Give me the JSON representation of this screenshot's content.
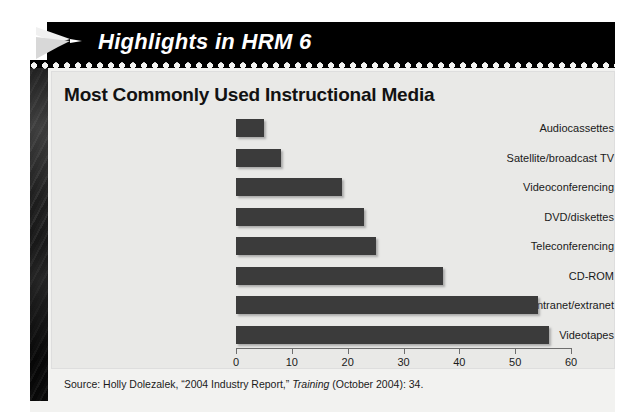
{
  "banner": {
    "title": "Highlights in HRM 6",
    "arrow_icon": "chevron-right-icon",
    "background_color": "#000000",
    "text_color": "#ffffff"
  },
  "card": {
    "title": "Most Commonly Used Instructional Media",
    "background_color": "#e9e9e7"
  },
  "source": {
    "prefix": "Source: Holly Dolezalek, “2004 Industry Report,” ",
    "italic": "Training",
    "suffix": " (October 2004): 34."
  },
  "chart_data": {
    "type": "bar",
    "orientation": "horizontal",
    "title": "Most Commonly Used Instructional Media",
    "categories": [
      "Audiocassettes",
      "Satellite/broadcast TV",
      "Videoconferencing",
      "DVD/diskettes",
      "Teleconferencing",
      "CD-ROM",
      "Internet/intranet/extranet",
      "Videotapes"
    ],
    "values": [
      5,
      8,
      19,
      23,
      25,
      37,
      54,
      56
    ],
    "xlabel": "",
    "ylabel": "",
    "xlim": [
      0,
      60
    ],
    "xticks": [
      0,
      10,
      20,
      30,
      40,
      50,
      60
    ],
    "xtick_labels": [
      "0",
      "10",
      "20",
      "30",
      "40",
      "50",
      "60"
    ],
    "grid": false,
    "legend": false,
    "bar_color": "#3b3b3b"
  }
}
